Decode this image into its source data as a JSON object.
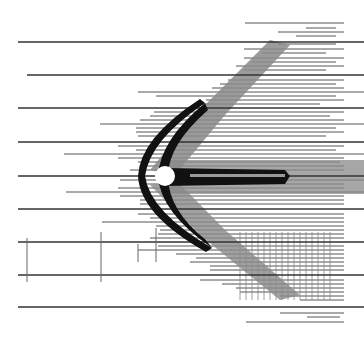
{
  "figure": {
    "width": 364,
    "height": 342,
    "colors": {
      "background": "#ffffff",
      "line": "#3a3a3a",
      "shock_dark": "#111111",
      "shock_gray": "#7a7a7a",
      "body": "#ffffff"
    },
    "body": {
      "cx": 165,
      "cy": 176,
      "r": 10
    },
    "long_lines": [
      {
        "y": 42,
        "x1": 18,
        "x2": 364
      },
      {
        "y": 75,
        "x1": 27,
        "x2": 364
      },
      {
        "y": 108,
        "x1": 18,
        "x2": 364
      },
      {
        "y": 142,
        "x1": 18,
        "x2": 364
      },
      {
        "y": 176,
        "x1": 18,
        "x2": 364
      },
      {
        "y": 209,
        "x1": 18,
        "x2": 364
      },
      {
        "y": 242,
        "x1": 18,
        "x2": 364
      },
      {
        "y": 275,
        "x1": 18,
        "x2": 364
      },
      {
        "y": 307,
        "x1": 18,
        "x2": 364
      }
    ],
    "right_lines": [
      {
        "y": 23,
        "x1": 245,
        "x2": 344
      },
      {
        "y": 28,
        "x1": 306,
        "x2": 336
      },
      {
        "y": 32,
        "x1": 278,
        "x2": 344
      },
      {
        "y": 36,
        "x1": 296,
        "x2": 336
      },
      {
        "y": 44,
        "x1": 278,
        "x2": 336
      },
      {
        "y": 49,
        "x1": 244,
        "x2": 344
      },
      {
        "y": 53,
        "x1": 262,
        "x2": 326
      },
      {
        "y": 58,
        "x1": 244,
        "x2": 344
      },
      {
        "y": 62,
        "x1": 252,
        "x2": 336
      },
      {
        "y": 66,
        "x1": 236,
        "x2": 344
      },
      {
        "y": 70,
        "x1": 244,
        "x2": 326
      },
      {
        "y": 80,
        "x1": 228,
        "x2": 344
      },
      {
        "y": 84,
        "x1": 220,
        "x2": 336
      },
      {
        "y": 88,
        "x1": 212,
        "x2": 344
      },
      {
        "y": 92,
        "x1": 138,
        "x2": 364
      },
      {
        "y": 96,
        "x1": 156,
        "x2": 336
      },
      {
        "y": 100,
        "x1": 206,
        "x2": 344
      },
      {
        "y": 104,
        "x1": 196,
        "x2": 320
      },
      {
        "y": 112,
        "x1": 154,
        "x2": 344
      },
      {
        "y": 116,
        "x1": 150,
        "x2": 330
      },
      {
        "y": 120,
        "x1": 140,
        "x2": 344
      },
      {
        "y": 124,
        "x1": 100,
        "x2": 364
      },
      {
        "y": 128,
        "x1": 136,
        "x2": 336
      },
      {
        "y": 132,
        "x1": 136,
        "x2": 344
      },
      {
        "y": 136,
        "x1": 138,
        "x2": 326
      },
      {
        "y": 146,
        "x1": 118,
        "x2": 344
      },
      {
        "y": 150,
        "x1": 136,
        "x2": 336
      },
      {
        "y": 154,
        "x1": 64,
        "x2": 364
      },
      {
        "y": 158,
        "x1": 118,
        "x2": 344
      },
      {
        "y": 162,
        "x1": 138,
        "x2": 340
      },
      {
        "y": 166,
        "x1": 144,
        "x2": 344
      },
      {
        "y": 170,
        "x1": 130,
        "x2": 344
      },
      {
        "y": 180,
        "x1": 120,
        "x2": 364
      },
      {
        "y": 184,
        "x1": 140,
        "x2": 344
      },
      {
        "y": 188,
        "x1": 118,
        "x2": 344
      },
      {
        "y": 192,
        "x1": 66,
        "x2": 364
      },
      {
        "y": 196,
        "x1": 120,
        "x2": 344
      },
      {
        "y": 200,
        "x1": 140,
        "x2": 344
      },
      {
        "y": 204,
        "x1": 140,
        "x2": 344
      },
      {
        "y": 214,
        "x1": 138,
        "x2": 344
      },
      {
        "y": 218,
        "x1": 150,
        "x2": 344
      },
      {
        "y": 222,
        "x1": 102,
        "x2": 344
      },
      {
        "y": 226,
        "x1": 156,
        "x2": 344
      },
      {
        "y": 230,
        "x1": 160,
        "x2": 344
      },
      {
        "y": 234,
        "x1": 158,
        "x2": 344
      },
      {
        "y": 238,
        "x1": 150,
        "x2": 344
      },
      {
        "y": 246,
        "x1": 158,
        "x2": 344
      },
      {
        "y": 250,
        "x1": 138,
        "x2": 344
      },
      {
        "y": 254,
        "x1": 176,
        "x2": 344
      },
      {
        "y": 258,
        "x1": 196,
        "x2": 344
      },
      {
        "y": 262,
        "x1": 190,
        "x2": 344
      },
      {
        "y": 266,
        "x1": 210,
        "x2": 344
      },
      {
        "y": 270,
        "x1": 210,
        "x2": 344
      },
      {
        "y": 280,
        "x1": 200,
        "x2": 344
      },
      {
        "y": 284,
        "x1": 222,
        "x2": 344
      },
      {
        "y": 288,
        "x1": 236,
        "x2": 344
      },
      {
        "y": 292,
        "x1": 240,
        "x2": 344
      },
      {
        "y": 296,
        "x1": 280,
        "x2": 344
      },
      {
        "y": 300,
        "x1": 300,
        "x2": 344
      },
      {
        "y": 313,
        "x1": 280,
        "x2": 344
      },
      {
        "y": 317,
        "x1": 307,
        "x2": 340
      },
      {
        "y": 322,
        "x1": 246,
        "x2": 344
      }
    ],
    "vertical_ticks": [
      {
        "x": 27,
        "y1": 238,
        "y2": 282
      },
      {
        "x": 101,
        "y1": 232,
        "y2": 282
      },
      {
        "x": 138,
        "y1": 244,
        "y2": 262
      },
      {
        "x": 156,
        "y1": 228,
        "y2": 262
      }
    ]
  }
}
